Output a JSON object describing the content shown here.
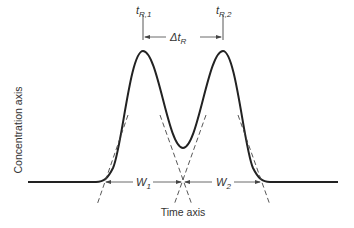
{
  "diagram": {
    "y_axis_label": "Concentration axis",
    "x_axis_label": "Time axis",
    "peak1_label": {
      "main": "t",
      "sub": "R,1"
    },
    "peak2_label": {
      "main": "t",
      "sub": "R,2"
    },
    "delta_label": {
      "main": "Δt",
      "sub": "R"
    },
    "width1_label": {
      "main": "W",
      "sub": "1"
    },
    "width2_label": {
      "main": "W",
      "sub": "2"
    },
    "colors": {
      "curve": "#222222",
      "annotation": "#444444"
    }
  }
}
